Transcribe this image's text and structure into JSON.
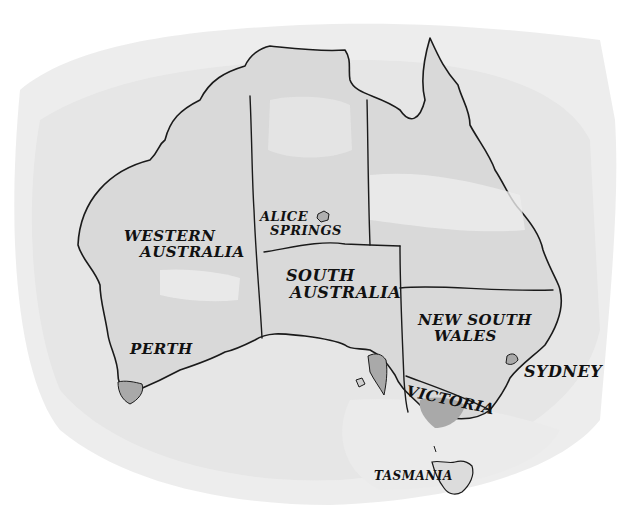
{
  "map": {
    "title": "Australia",
    "style": "watercolor-ink",
    "colors": {
      "wash_light": "#e6e6e6",
      "wash_mid": "#d6d6d6",
      "land": "#dcdcdc",
      "land_dark": "#c4c4c4",
      "city_fill": "#a9a9a9",
      "ink": "#1a1a1a"
    },
    "regions": [
      {
        "id": "western-australia",
        "label_lines": [
          "WESTERN",
          "AUSTRALIA"
        ]
      },
      {
        "id": "northern-territory",
        "label_lines": []
      },
      {
        "id": "queensland",
        "label_lines": []
      },
      {
        "id": "south-australia",
        "label_lines": [
          "SOUTH",
          "AUSTRALIA"
        ]
      },
      {
        "id": "new-south-wales",
        "label_lines": [
          "NEW SOUTH",
          "WALES"
        ]
      },
      {
        "id": "victoria",
        "label_lines": [
          "VICTORIA"
        ]
      },
      {
        "id": "tasmania",
        "label_lines": [
          "TASMANIA"
        ]
      }
    ],
    "cities": [
      {
        "id": "alice-springs",
        "label_lines": [
          "ALICE",
          "SPRINGS"
        ]
      },
      {
        "id": "perth",
        "label_lines": [
          "PERTH"
        ]
      },
      {
        "id": "sydney",
        "label_lines": [
          "SYDNEY"
        ]
      }
    ]
  }
}
